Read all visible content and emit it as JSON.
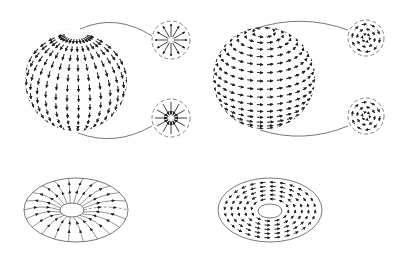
{
  "figure": {
    "description": "Vector fields on a sphere and a torus: radial (hedgehog) field vs. tangential (combed) field",
    "colors": {
      "background": "#ffffff",
      "stroke": "#2a2a2a",
      "outline": "#555555",
      "dashed": "#666666"
    },
    "panels": [
      {
        "id": "sphere-meridional",
        "shape": "sphere",
        "field": "meridional",
        "center": [
          76,
          80
        ],
        "radius": 52,
        "insets": [
          {
            "id": "north-pole-source",
            "pattern": "radial-outward",
            "center": [
              171,
              40
            ],
            "radius": 19
          },
          {
            "id": "south-pole-sink",
            "pattern": "radial-inward",
            "center": [
              171,
              118
            ],
            "radius": 19
          }
        ]
      },
      {
        "id": "sphere-latitudinal",
        "shape": "sphere",
        "field": "latitudinal",
        "center": [
          264,
          78
        ],
        "radius": 52,
        "insets": [
          {
            "id": "north-pole-vortex",
            "pattern": "concentric",
            "center": [
              366,
              38
            ],
            "radius": 18
          },
          {
            "id": "south-pole-vortex",
            "pattern": "concentric",
            "center": [
              366,
              116
            ],
            "radius": 18
          }
        ]
      },
      {
        "id": "torus-meridional",
        "shape": "torus",
        "field": "meridional",
        "center": [
          76,
          210
        ],
        "rx": 52,
        "ry": 32,
        "hole": {
          "center": [
            72,
            210
          ],
          "rx": 12,
          "ry": 7
        }
      },
      {
        "id": "torus-latitudinal",
        "shape": "torus",
        "field": "latitudinal",
        "center": [
          270,
          210
        ],
        "rx": 52,
        "ry": 32,
        "hole": {
          "center": [
            270,
            211
          ],
          "rx": 12,
          "ry": 7
        }
      }
    ]
  }
}
